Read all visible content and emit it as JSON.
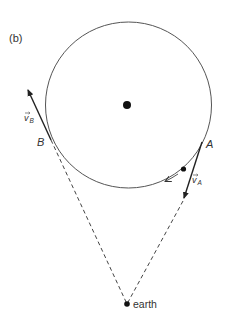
{
  "figure": {
    "panel_label": "(b)",
    "colors": {
      "stroke": "#333333",
      "dot": "#111111",
      "background": "#ffffff"
    },
    "orbit": {
      "center": [
        128.5,
        105
      ],
      "radius": 83
    },
    "center_body": {
      "label": "",
      "position": [
        127,
        105
      ]
    },
    "points": {
      "A": {
        "label": "A",
        "position": [
          202,
          142
        ]
      },
      "B": {
        "label": "B",
        "position": [
          51,
          140
        ]
      },
      "earth": {
        "label": "earth",
        "position": [
          127,
          304
        ]
      },
      "satellite": {
        "position": [
          183,
          169
        ]
      }
    },
    "vectors": {
      "v_A": {
        "label": "v",
        "subscript": "A",
        "from": [
          202,
          142
        ],
        "to": [
          183,
          201
        ]
      },
      "v_B": {
        "label": "v",
        "subscript": "B",
        "from": [
          51,
          140
        ],
        "to": [
          27,
          88
        ]
      }
    },
    "sight_lines": [
      {
        "from": "B",
        "to": "earth",
        "style": "dashed"
      },
      {
        "from": "A",
        "to": "earth",
        "style": "dashed"
      }
    ],
    "orbit_direction": "counterclockwise"
  }
}
